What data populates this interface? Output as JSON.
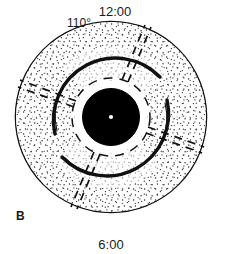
{
  "figure": {
    "panel_label": "B",
    "labels": {
      "top_clock": "12:00",
      "bottom_clock": "6:00",
      "angle": "110°"
    },
    "colors": {
      "ink": "#111111",
      "stipple": "#2b2b2b",
      "background": "#ffffff",
      "pupil_fill": "#000000",
      "center_dot": "#ffffff"
    },
    "geometry": {
      "center_x": 111,
      "center_y": 117,
      "outer_radius": 96,
      "pupil_radius": 28,
      "dashed_ring_radius": 39,
      "arc_radius": 62
    },
    "elements": {
      "outer_disk_name": "stippled outer disk",
      "pupil_name": "central opaque disk",
      "center_dot_name": "center fixation dot",
      "dashed_ring_name": "dashed inner ring",
      "radial_marker_count": 4,
      "arc_count": 2
    }
  }
}
